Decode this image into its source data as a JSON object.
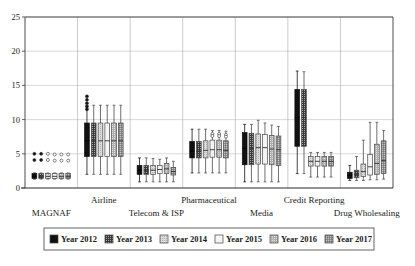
{
  "chart_data": {
    "type": "box",
    "title": "",
    "xlabel": "",
    "ylabel": "",
    "ylim": [
      0,
      25
    ],
    "yticks": [
      0,
      5,
      10,
      15,
      20,
      25
    ],
    "ytick_labels": [
      "0",
      "5",
      "10",
      "15",
      "20",
      "25"
    ],
    "grid": true,
    "legend_position": "bottom",
    "categories": [
      "MAGNAF",
      "Airline",
      "Telecom & ISP",
      "Pharmaceutical",
      "Media",
      "Credit Reporting",
      "Drug Wholesaling"
    ],
    "category_label_rows": [
      1,
      0,
      1,
      0,
      1,
      0,
      1
    ],
    "series": [
      {
        "name": "Year 2012",
        "fill": "#111111",
        "pattern": "solid"
      },
      {
        "name": "Year 2013",
        "fill": "#3a3a3a",
        "pattern": "dense-dots"
      },
      {
        "name": "Year 2014",
        "fill": "#d4d4d4",
        "pattern": "light-dots"
      },
      {
        "name": "Year 2015",
        "fill": "#f0f0f0",
        "pattern": "empty"
      },
      {
        "name": "Year 2016",
        "fill": "#a8a8a8",
        "pattern": "mid-dots"
      },
      {
        "name": "Year 2017",
        "fill": "#8c8c8c",
        "pattern": "cross-dots"
      }
    ],
    "boxes": [
      {
        "group": "MAGNAF",
        "series": "Year 2012",
        "whisker_low": 1.3,
        "q1": 1.4,
        "median": 1.7,
        "q3": 2.1,
        "whisker_high": 2.2,
        "outliers": [
          5.0,
          4.1
        ]
      },
      {
        "group": "MAGNAF",
        "series": "Year 2013",
        "whisker_low": 1.3,
        "q1": 1.4,
        "median": 1.7,
        "q3": 2.1,
        "whisker_high": 2.2,
        "outliers": [
          5.0,
          4.1
        ]
      },
      {
        "group": "MAGNAF",
        "series": "Year 2014",
        "whisker_low": 1.3,
        "q1": 1.4,
        "median": 1.7,
        "q3": 2.1,
        "whisker_high": 2.2,
        "outliers": [
          5.0,
          4.1
        ]
      },
      {
        "group": "MAGNAF",
        "series": "Year 2015",
        "whisker_low": 1.3,
        "q1": 1.4,
        "median": 1.7,
        "q3": 2.1,
        "whisker_high": 2.2,
        "outliers": [
          4.9,
          4.0
        ]
      },
      {
        "group": "MAGNAF",
        "series": "Year 2016",
        "whisker_low": 1.3,
        "q1": 1.4,
        "median": 1.7,
        "q3": 2.1,
        "whisker_high": 2.2,
        "outliers": [
          4.9,
          4.0
        ]
      },
      {
        "group": "MAGNAF",
        "series": "Year 2017",
        "whisker_low": 1.3,
        "q1": 1.4,
        "median": 1.7,
        "q3": 2.1,
        "whisker_high": 2.2,
        "outliers": [
          4.9,
          4.0
        ]
      },
      {
        "group": "Airline",
        "series": "Year 2012",
        "whisker_low": 2.0,
        "q1": 4.6,
        "median": 6.9,
        "q3": 9.5,
        "whisker_high": 12.1,
        "outliers": [
          13.4,
          12.9,
          12.4,
          11.9,
          11.5
        ]
      },
      {
        "group": "Airline",
        "series": "Year 2013",
        "whisker_low": 2.0,
        "q1": 4.6,
        "median": 6.9,
        "q3": 9.5,
        "whisker_high": 12.1,
        "outliers": []
      },
      {
        "group": "Airline",
        "series": "Year 2014",
        "whisker_low": 2.0,
        "q1": 4.6,
        "median": 6.9,
        "q3": 9.5,
        "whisker_high": 12.1,
        "outliers": []
      },
      {
        "group": "Airline",
        "series": "Year 2015",
        "whisker_low": 2.0,
        "q1": 4.6,
        "median": 6.9,
        "q3": 9.5,
        "whisker_high": 12.1,
        "outliers": []
      },
      {
        "group": "Airline",
        "series": "Year 2016",
        "whisker_low": 2.0,
        "q1": 4.6,
        "median": 6.9,
        "q3": 9.5,
        "whisker_high": 12.1,
        "outliers": []
      },
      {
        "group": "Airline",
        "series": "Year 2017",
        "whisker_low": 2.0,
        "q1": 4.6,
        "median": 6.9,
        "q3": 9.5,
        "whisker_high": 12.1,
        "outliers": []
      },
      {
        "group": "Telecom & ISP",
        "series": "Year 2012",
        "whisker_low": 0.9,
        "q1": 2.0,
        "median": 2.6,
        "q3": 3.3,
        "whisker_high": 4.4,
        "outliers": []
      },
      {
        "group": "Telecom & ISP",
        "series": "Year 2013",
        "whisker_low": 0.9,
        "q1": 2.0,
        "median": 2.6,
        "q3": 3.3,
        "whisker_high": 4.4,
        "outliers": []
      },
      {
        "group": "Telecom & ISP",
        "series": "Year 2014",
        "whisker_low": 0.9,
        "q1": 2.0,
        "median": 2.6,
        "q3": 3.3,
        "whisker_high": 4.3,
        "outliers": []
      },
      {
        "group": "Telecom & ISP",
        "series": "Year 2015",
        "whisker_low": 0.9,
        "q1": 2.1,
        "median": 2.7,
        "q3": 3.3,
        "whisker_high": 4.2,
        "outliers": []
      },
      {
        "group": "Telecom & ISP",
        "series": "Year 2016",
        "whisker_low": 0.9,
        "q1": 2.1,
        "median": 2.8,
        "q3": 3.6,
        "whisker_high": 4.4,
        "outliers": []
      },
      {
        "group": "Telecom & ISP",
        "series": "Year 2017",
        "whisker_low": 0.9,
        "q1": 1.9,
        "median": 2.4,
        "q3": 3.0,
        "whisker_high": 3.9,
        "outliers": []
      },
      {
        "group": "Pharmaceutical",
        "series": "Year 2012",
        "whisker_low": 2.2,
        "q1": 4.4,
        "median": 5.4,
        "q3": 6.8,
        "whisker_high": 8.6,
        "outliers": []
      },
      {
        "group": "Pharmaceutical",
        "series": "Year 2013",
        "whisker_low": 2.2,
        "q1": 4.4,
        "median": 5.4,
        "q3": 6.8,
        "whisker_high": 8.6,
        "outliers": []
      },
      {
        "group": "Pharmaceutical",
        "series": "Year 2014",
        "whisker_low": 2.2,
        "q1": 4.4,
        "median": 5.5,
        "q3": 6.9,
        "whisker_high": 8.6,
        "outliers": []
      },
      {
        "group": "Pharmaceutical",
        "series": "Year 2015",
        "whisker_low": 2.2,
        "q1": 4.5,
        "median": 5.6,
        "q3": 7.0,
        "whisker_high": 8.4,
        "outliers": [
          7.9,
          7.6
        ]
      },
      {
        "group": "Pharmaceutical",
        "series": "Year 2016",
        "whisker_low": 2.2,
        "q1": 4.5,
        "median": 5.6,
        "q3": 7.0,
        "whisker_high": 8.4,
        "outliers": [
          7.9,
          7.6
        ]
      },
      {
        "group": "Pharmaceutical",
        "series": "Year 2017",
        "whisker_low": 2.2,
        "q1": 4.4,
        "median": 5.5,
        "q3": 6.9,
        "whisker_high": 8.3,
        "outliers": [
          7.8,
          7.5
        ]
      },
      {
        "group": "Media",
        "series": "Year 2012",
        "whisker_low": 0.9,
        "q1": 3.4,
        "median": 5.8,
        "q3": 8.1,
        "whisker_high": 9.3,
        "outliers": []
      },
      {
        "group": "Media",
        "series": "Year 2013",
        "whisker_low": 0.9,
        "q1": 3.4,
        "median": 5.8,
        "q3": 8.0,
        "whisker_high": 9.3,
        "outliers": []
      },
      {
        "group": "Media",
        "series": "Year 2014",
        "whisker_low": 0.9,
        "q1": 3.5,
        "median": 5.9,
        "q3": 7.9,
        "whisker_high": 9.9,
        "outliers": []
      },
      {
        "group": "Media",
        "series": "Year 2015",
        "whisker_low": 0.9,
        "q1": 3.5,
        "median": 5.9,
        "q3": 7.8,
        "whisker_high": 9.5,
        "outliers": []
      },
      {
        "group": "Media",
        "series": "Year 2016",
        "whisker_low": 0.9,
        "q1": 3.4,
        "median": 5.7,
        "q3": 7.7,
        "whisker_high": 9.2,
        "outliers": []
      },
      {
        "group": "Media",
        "series": "Year 2017",
        "whisker_low": 0.9,
        "q1": 3.3,
        "median": 5.6,
        "q3": 7.6,
        "whisker_high": 9.0,
        "outliers": []
      },
      {
        "group": "Credit Reporting",
        "series": "Year 2012",
        "whisker_low": 2.1,
        "q1": 6.1,
        "median": 10.3,
        "q3": 14.4,
        "whisker_high": 17.1,
        "outliers": []
      },
      {
        "group": "Credit Reporting",
        "series": "Year 2013",
        "whisker_low": 2.1,
        "q1": 6.1,
        "median": 10.3,
        "q3": 14.4,
        "whisker_high": 17.0,
        "outliers": []
      },
      {
        "group": "Credit Reporting",
        "series": "Year 2014",
        "whisker_low": 1.6,
        "q1": 3.2,
        "median": 3.9,
        "q3": 4.6,
        "whisker_high": 5.2,
        "outliers": []
      },
      {
        "group": "Credit Reporting",
        "series": "Year 2015",
        "whisker_low": 1.6,
        "q1": 3.2,
        "median": 3.9,
        "q3": 4.6,
        "whisker_high": 5.2,
        "outliers": []
      },
      {
        "group": "Credit Reporting",
        "series": "Year 2016",
        "whisker_low": 1.6,
        "q1": 3.2,
        "median": 3.9,
        "q3": 4.6,
        "whisker_high": 5.2,
        "outliers": []
      },
      {
        "group": "Credit Reporting",
        "series": "Year 2017",
        "whisker_low": 1.6,
        "q1": 3.2,
        "median": 3.9,
        "q3": 4.6,
        "whisker_high": 5.2,
        "outliers": []
      },
      {
        "group": "Drug Wholesaling",
        "series": "Year 2012",
        "whisker_low": 1.1,
        "q1": 1.4,
        "median": 1.8,
        "q3": 2.3,
        "whisker_high": 3.3,
        "outliers": []
      },
      {
        "group": "Drug Wholesaling",
        "series": "Year 2013",
        "whisker_low": 1.1,
        "q1": 1.5,
        "median": 2.0,
        "q3": 2.6,
        "whisker_high": 4.6,
        "outliers": []
      },
      {
        "group": "Drug Wholesaling",
        "series": "Year 2014",
        "whisker_low": 1.1,
        "q1": 1.7,
        "median": 2.4,
        "q3": 3.5,
        "whisker_high": 7.0,
        "outliers": []
      },
      {
        "group": "Drug Wholesaling",
        "series": "Year 2015",
        "whisker_low": 1.2,
        "q1": 1.9,
        "median": 3.1,
        "q3": 4.9,
        "whisker_high": 9.6,
        "outliers": []
      },
      {
        "group": "Drug Wholesaling",
        "series": "Year 2016",
        "whisker_low": 1.2,
        "q1": 2.0,
        "median": 3.6,
        "q3": 6.4,
        "whisker_high": 9.6,
        "outliers": []
      },
      {
        "group": "Drug Wholesaling",
        "series": "Year 2017",
        "whisker_low": 1.3,
        "q1": 2.1,
        "median": 4.0,
        "q3": 6.9,
        "whisker_high": 8.4,
        "outliers": []
      }
    ]
  },
  "legend": {
    "items": [
      {
        "label": "Year 2012"
      },
      {
        "label": "Year 2013"
      },
      {
        "label": "Year 2014"
      },
      {
        "label": "Year 2015"
      },
      {
        "label": "Year 2016"
      },
      {
        "label": "Year 2017"
      }
    ]
  }
}
